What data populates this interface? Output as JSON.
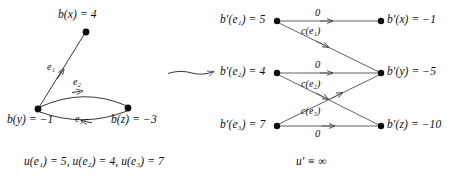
{
  "figure": {
    "title": "",
    "background": "#ffffff",
    "ink": "#0d0d0d"
  },
  "left_graph": {
    "caption": "u(e₁) = 5,  u(e₂) = 4,  u(e₃) = 7",
    "nodes": [
      {
        "id": "x",
        "label": "b(x) = 4",
        "balance": 4,
        "cx": 86,
        "cy": 32
      },
      {
        "id": "y",
        "label": "b(y) = −1",
        "balance": -1,
        "cx": 38,
        "cy": 109
      },
      {
        "id": "z",
        "label": "b(z) = −3",
        "balance": -3,
        "cx": 128,
        "cy": 108
      }
    ],
    "edges": [
      {
        "id": "e1",
        "label": "e₁",
        "from": "y",
        "to": "x",
        "capacity": 5,
        "shape": "straight"
      },
      {
        "id": "e2",
        "label": "e₂",
        "from": "y",
        "to": "z",
        "capacity": 4,
        "shape": "arc-up"
      },
      {
        "id": "e3",
        "label": "e₃",
        "from": "z",
        "to": "y",
        "capacity": 7,
        "shape": "arc-down"
      }
    ]
  },
  "transform_arrow": {
    "name": "transformation-arrow",
    "x1": 168,
    "y1": 74,
    "x2": 216,
    "y2": 71
  },
  "right_graph": {
    "caption": "u′ ≡ ∞",
    "edge_nodes": [
      {
        "id": "e1",
        "label": "b′(e₁) = 5",
        "balance": 5,
        "cx": 277,
        "cy": 21
      },
      {
        "id": "e2",
        "label": "b′(e₂) = 4",
        "balance": 4,
        "cx": 277,
        "cy": 73
      },
      {
        "id": "e3",
        "label": "b′(e₃) = 7",
        "balance": 7,
        "cx": 277,
        "cy": 126
      }
    ],
    "vertex_nodes": [
      {
        "id": "x",
        "label": "b′(x) = −1",
        "balance": -1,
        "cx": 381,
        "cy": 21
      },
      {
        "id": "y",
        "label": "b′(y) = −5",
        "balance": -5,
        "cx": 381,
        "cy": 73
      },
      {
        "id": "z",
        "label": "b′(z) = −10",
        "balance": -10,
        "cx": 381,
        "cy": 126
      }
    ],
    "arcs": [
      {
        "from": "e1",
        "to": "x",
        "label": "0",
        "label_x": 317,
        "label_y": 9
      },
      {
        "from": "e1",
        "to": "y",
        "label": "c(e₁)",
        "label_x": 303,
        "label_y": 28
      },
      {
        "from": "e2",
        "to": "y",
        "label": "0",
        "label_x": 317,
        "label_y": 61
      },
      {
        "from": "e2",
        "to": "z",
        "label": "c(e₂)",
        "label_x": 303,
        "label_y": 81
      },
      {
        "from": "e3",
        "to": "y",
        "label": "c(e₃)",
        "label_x": 303,
        "label_y": 108
      },
      {
        "from": "e3",
        "to": "z",
        "label": "0",
        "label_x": 317,
        "label_y": 130
      }
    ]
  }
}
